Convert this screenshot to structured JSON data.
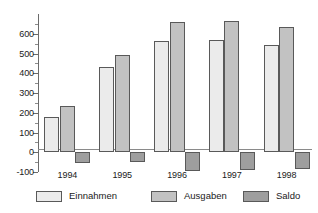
{
  "chart_data": {
    "type": "bar",
    "title": "",
    "subtitle": "",
    "xlabel": "",
    "ylabel": "",
    "categories": [
      "1994",
      "1995",
      "1996",
      "1997",
      "1998"
    ],
    "series": [
      {
        "name": "Einnahmen",
        "color": "#ebebeb",
        "values": [
          180,
          432,
          562,
          568,
          543
        ]
      },
      {
        "name": "Ausgaben",
        "color": "#c2c2c2",
        "values": [
          235,
          492,
          660,
          665,
          632
        ]
      },
      {
        "name": "Saldo",
        "color": "#9e9e9e",
        "values": [
          -52,
          -48,
          -93,
          -90,
          -83
        ]
      }
    ],
    "ylim": [
      -100,
      700
    ],
    "yticks": [
      -100,
      0,
      100,
      200,
      300,
      400,
      500,
      600
    ],
    "ytick_labels": [
      "-100",
      "0",
      "100",
      "200",
      "300",
      "400",
      "500",
      "600"
    ],
    "minor_tick_step": 50,
    "grid": false,
    "legend_position": "bottom",
    "zero_line": true
  },
  "legend": {
    "items": [
      {
        "label": "Einnahmen",
        "swatch": "einnahmen"
      },
      {
        "label": "Ausgaben",
        "swatch": "ausgaben"
      },
      {
        "label": "Saldo",
        "swatch": "saldo"
      }
    ]
  }
}
